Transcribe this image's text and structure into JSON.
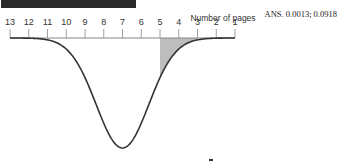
{
  "chart_data": {
    "type": "area",
    "title": "",
    "xlabel": "Number of pages",
    "ylabel": "",
    "x_ticks": [
      1,
      2,
      3,
      4,
      5,
      6,
      7,
      8,
      9,
      10,
      11,
      12,
      13
    ],
    "xlim": [
      1,
      13
    ],
    "distribution": {
      "kind": "normal",
      "mean": 7,
      "sd": 1.4
    },
    "shaded_region": {
      "from": 3,
      "to": 5
    },
    "annotation": "ANS. 0.0013; 0.0918",
    "grid": false,
    "colors": {
      "curve": "#333333",
      "shade": "#bdbdbd",
      "axis": "#888888",
      "bar": "#2a2a2a"
    }
  }
}
